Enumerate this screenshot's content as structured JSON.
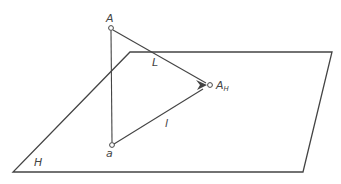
{
  "diagram": {
    "plane": {
      "label": "H",
      "corners": [
        [
          130,
          52
        ],
        [
          332,
          52
        ],
        [
          303,
          172
        ],
        [
          13,
          172
        ]
      ],
      "label_pos": [
        34,
        166
      ]
    },
    "points": {
      "A": {
        "label": "A",
        "pos": [
          111,
          28
        ],
        "label_pos": [
          106,
          22
        ]
      },
      "AH": {
        "label": "A",
        "subscript": "H",
        "pos": [
          210,
          85
        ],
        "label_pos": [
          216,
          89
        ]
      },
      "a": {
        "label": "a",
        "pos": [
          112,
          145
        ],
        "label_pos": [
          106,
          157
        ]
      }
    },
    "lines": {
      "L": {
        "label": "L",
        "from": "A",
        "to": "AH",
        "label_pos": [
          152,
          66
        ]
      },
      "l": {
        "label": "l",
        "from": "a",
        "to": "AH",
        "label_pos": [
          165,
          127
        ]
      },
      "vertical": {
        "from": "A",
        "to": "a"
      }
    },
    "colors": {
      "stroke": "#444444",
      "background": "#ffffff"
    }
  }
}
